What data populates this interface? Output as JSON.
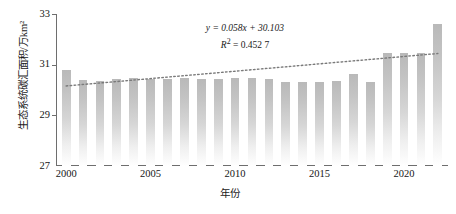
{
  "chart_data": {
    "type": "bar",
    "title": "",
    "subtitle": "",
    "xlabel": "年份",
    "ylabel": "生态系统碳汇面积/万km²",
    "ylim": [
      27,
      33
    ],
    "y_ticks": [
      27,
      29,
      31,
      33
    ],
    "xlim": [
      1999.4,
      2022.6
    ],
    "x_ticks": [
      2000,
      2005,
      2010,
      2015,
      2020
    ],
    "grid": false,
    "legend": null,
    "categories": [
      "2000",
      "2001",
      "2002",
      "2003",
      "2004",
      "2005",
      "2006",
      "2007",
      "2008",
      "2009",
      "2010",
      "2011",
      "2012",
      "2013",
      "2014",
      "2015",
      "2016",
      "2017",
      "2018",
      "2019",
      "2020",
      "2021",
      "2022"
    ],
    "values": [
      30.8,
      30.38,
      30.35,
      30.43,
      30.47,
      30.43,
      30.44,
      30.47,
      30.45,
      30.44,
      30.47,
      30.49,
      30.42,
      30.3,
      30.3,
      30.33,
      30.36,
      30.63,
      30.33,
      30.3,
      31.46,
      31.46,
      31.45
    ],
    "values_note_tail": [
      31.46,
      31.46,
      31.45,
      32.6
    ],
    "series": [
      {
        "name": "生态系统碳汇面积",
        "type": "bar",
        "values": [
          30.8,
          30.38,
          30.35,
          30.43,
          30.47,
          30.43,
          30.44,
          30.47,
          30.45,
          30.44,
          30.47,
          30.49,
          30.42,
          30.3,
          30.3,
          30.33,
          30.36,
          30.63,
          30.33,
          30.3,
          31.46,
          31.46,
          31.45
        ]
      },
      {
        "name": "线性趋势线",
        "type": "line",
        "style": "dotted",
        "endpoints_y": [
          30.16,
          31.44
        ]
      }
    ],
    "annotations": [
      {
        "text": "y = 0.058x + 30.103",
        "kind": "regression-equation"
      },
      {
        "text": "R² = 0.452 7",
        "kind": "r-squared"
      }
    ],
    "regression": {
      "slope": 0.058,
      "intercept": 30.103,
      "r_squared": "0.452 7"
    },
    "colors": {
      "bar_top": "#b9b9b9",
      "bar_bottom": "#ffffff",
      "axis": "#6e6e6e",
      "trend_line": "#7a7a7a",
      "text": "#161616"
    }
  },
  "axes": {
    "y_title": "生态系统碳汇面积/万km²",
    "x_title": "年份",
    "y_tick_labels": [
      "33",
      "31",
      "29",
      "27"
    ],
    "x_tick_labels": [
      "2000",
      "2005",
      "2010",
      "2015",
      "2020"
    ]
  },
  "annotation": {
    "equation": "y = 0.058x + 30.103",
    "r_squared_prefix": "R",
    "r_squared_sup": "2",
    "r_squared_value": " = 0.452 7"
  }
}
